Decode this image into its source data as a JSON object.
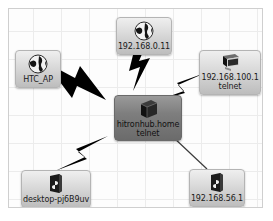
{
  "diagram": {
    "type": "network-topology",
    "background_color": "#fdfdfd",
    "grid_color": "#ececec",
    "border_color": "#cfcfcf",
    "link_color": "#000000"
  },
  "nodes": [
    {
      "id": "center",
      "name": "hitronhub-home",
      "icon": "router-box-icon",
      "label": "hitronhub.home",
      "sublabel": "telnet",
      "role": "gateway"
    },
    {
      "id": "top",
      "name": "host-192-168-0-11",
      "icon": "globe-icon",
      "label": "192.168.0.11",
      "sublabel": "",
      "role": "host"
    },
    {
      "id": "left",
      "name": "htc-ap",
      "icon": "globe-icon",
      "label": "HTC_AP",
      "sublabel": "",
      "role": "access-point"
    },
    {
      "id": "right",
      "name": "host-192-168-100-1",
      "icon": "monitor-icon",
      "label": "192.168.100.1",
      "sublabel": "telnet",
      "role": "host"
    },
    {
      "id": "bottomleft",
      "name": "desktop-pj6b9uv",
      "icon": "laptop-icon",
      "label": "desktop-pj6B9uv",
      "sublabel": "",
      "role": "workstation"
    },
    {
      "id": "bottomright",
      "name": "host-192-168-56-1",
      "icon": "laptop-icon",
      "label": "192.168.56.1",
      "sublabel": "",
      "role": "host"
    }
  ],
  "links": [
    {
      "from": "center",
      "to": "top",
      "style": "bolt"
    },
    {
      "from": "center",
      "to": "left",
      "style": "bolt"
    },
    {
      "from": "center",
      "to": "right",
      "style": "bolt"
    },
    {
      "from": "center",
      "to": "bottomleft",
      "style": "bolt"
    },
    {
      "from": "center",
      "to": "bottomright",
      "style": "line"
    }
  ]
}
